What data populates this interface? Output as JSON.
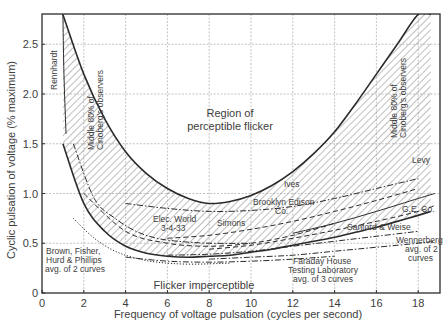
{
  "chart_data": {
    "type": "line",
    "title": "",
    "xlabel": "Frequency of voltage pulsation (cycles per second)",
    "ylabel": "Cyclic pulsation of voltage (% maximum)",
    "xlim": [
      0,
      19
    ],
    "ylim": [
      0,
      2.8
    ],
    "x_ticks": [
      0,
      2,
      4,
      6,
      8,
      10,
      12,
      14,
      16,
      18
    ],
    "x_tick_labels": [
      "0",
      "2",
      "4",
      "6",
      "8",
      "10",
      "12",
      "14",
      "16",
      "18"
    ],
    "y_ticks": [
      0,
      0.5,
      1.0,
      1.5,
      2.0,
      2.5
    ],
    "y_tick_labels": [
      "0",
      "0.5",
      "1.0",
      "1.5",
      "2.0",
      "2.5"
    ],
    "grid": true,
    "legend": "none (curves labeled inline)",
    "regions": {
      "upper": "Region of perceptible flicker",
      "lower": "Flicker imperceptible"
    },
    "band": {
      "name": "Middle 80% of Cinoberg's observers",
      "upper_boundary": {
        "x": [
          1.0,
          2.0,
          3.0,
          4.0,
          5.0,
          6.0,
          7.0,
          8.0,
          9.0,
          10.0,
          11.0,
          12.0,
          13.0,
          14.0,
          15.0,
          16.0,
          17.0,
          18.0,
          18.6
        ],
        "y": [
          2.8,
          2.2,
          1.75,
          1.42,
          1.2,
          1.05,
          0.95,
          0.9,
          0.92,
          0.98,
          1.08,
          1.22,
          1.4,
          1.62,
          1.9,
          2.2,
          2.5,
          2.8,
          2.8
        ]
      },
      "lower_boundary": {
        "x": [
          1.0,
          2.0,
          3.0,
          4.0,
          5.0,
          6.0,
          7.0,
          8.0,
          9.0,
          10.0,
          11.0,
          12.0,
          13.0,
          14.0,
          15.0,
          16.0,
          17.0,
          18.0,
          18.6
        ],
        "y": [
          1.5,
          0.9,
          0.62,
          0.47,
          0.4,
          0.37,
          0.36,
          0.37,
          0.38,
          0.41,
          0.44,
          0.48,
          0.52,
          0.56,
          0.61,
          0.66,
          0.72,
          0.78,
          0.82
        ]
      }
    },
    "series": [
      {
        "name": "Rennhardt",
        "style": "solid",
        "x": [
          1.0,
          1.05,
          1.15
        ],
        "y": [
          2.8,
          2.2,
          1.6
        ]
      },
      {
        "name": "Elec. World 3-4-33",
        "style": "dash-dot",
        "x": [
          1.5,
          2.5,
          3.5,
          4.5,
          5.5,
          6.5,
          8.0,
          10.0
        ],
        "y": [
          1.5,
          0.95,
          0.75,
          0.62,
          0.55,
          0.52,
          0.5,
          0.5
        ]
      },
      {
        "name": "Simons",
        "style": "dashed",
        "x": [
          2.0,
          4.0,
          6.0,
          8.0,
          10.0,
          12.0,
          14.0
        ],
        "y": [
          1.0,
          0.62,
          0.5,
          0.47,
          0.5,
          0.58,
          0.7
        ]
      },
      {
        "name": "Ives",
        "style": "dash-dot",
        "x": [
          4.0,
          6.0,
          8.0,
          10.0,
          12.0,
          14.0,
          16.0,
          18.0
        ],
        "y": [
          0.9,
          0.85,
          0.82,
          0.83,
          0.87,
          0.95,
          1.05,
          1.15
        ]
      },
      {
        "name": "Brooklyn Edison Co.",
        "style": "dashed",
        "x": [
          6.0,
          8.0,
          10.0,
          12.0,
          14.0,
          16.0,
          18.0
        ],
        "y": [
          0.55,
          0.58,
          0.64,
          0.72,
          0.82,
          0.93,
          1.05
        ]
      },
      {
        "name": "Levy",
        "style": "solid",
        "x": [
          12.0,
          14.0,
          16.0,
          18.0,
          18.8
        ],
        "y": [
          0.6,
          0.7,
          0.82,
          0.95,
          1.0
        ]
      },
      {
        "name": "G.E. Co.",
        "style": "dashed",
        "x": [
          8.0,
          10.0,
          12.0,
          14.0,
          16.0,
          18.0,
          18.8
        ],
        "y": [
          0.44,
          0.48,
          0.55,
          0.63,
          0.72,
          0.82,
          0.88
        ]
      },
      {
        "name": "Sanford & Weise",
        "style": "dash-dot",
        "x": [
          6.0,
          8.0,
          10.0,
          12.0,
          14.0,
          16.0,
          18.0
        ],
        "y": [
          0.38,
          0.39,
          0.42,
          0.47,
          0.52,
          0.57,
          0.62
        ]
      },
      {
        "name": "Wennerberg avg. of 2 curves",
        "style": "dash-dot",
        "x": [
          8.0,
          10.0,
          12.0,
          14.0,
          16.0,
          18.0,
          18.8
        ],
        "y": [
          0.34,
          0.36,
          0.38,
          0.42,
          0.46,
          0.5,
          0.52
        ]
      },
      {
        "name": "Faraday House Testing Laboratory avg. of 3 curves",
        "style": "dash-dot",
        "x": [
          4.0,
          6.0,
          8.0,
          10.0,
          12.0,
          14.0
        ],
        "y": [
          0.36,
          0.32,
          0.31,
          0.32,
          0.34,
          0.37
        ]
      },
      {
        "name": "Brown, Fisher, Hurd & Phillips avg. of 2 curves",
        "style": "dotted",
        "x": [
          1.5,
          2.5,
          3.5,
          4.5,
          5.5,
          7.0,
          9.0
        ],
        "y": [
          0.75,
          0.55,
          0.42,
          0.35,
          0.31,
          0.29,
          0.3
        ]
      }
    ],
    "annotations": [
      "Rennhardt",
      "Middle 80% of Cinoberg's observers",
      "Middle 80% of Cinoberg's observers",
      "Region of perceptible flicker",
      "Ives",
      "Brooklyn Edison Co.",
      "Levy",
      "G.E. Co.",
      "Elec. World 3-4-33",
      "Simons",
      "Sanford & Weise",
      "Wennerberg avg. of 2 curves",
      "Brown, Fisher, Hurd & Phillips avg. of 2 curves",
      "Faraday House Testing Laboratory avg. of 3 curves",
      "Flicker imperceptible"
    ]
  },
  "labels": {
    "x_axis": "Frequency of voltage pulsation (cycles per second)",
    "y_axis": "Cyclic pulsation of voltage (% maximum)",
    "region_upper_1": "Region of",
    "region_upper_2": "perceptible flicker",
    "region_lower": "Flicker imperceptible",
    "rennhardt": "Rennhardt",
    "band_left_1": "Middle 80% of",
    "band_left_2": "Cinoberg's observers",
    "band_right_1": "Middle 80% of",
    "band_right_2": "Cinoberg's observers",
    "ives": "Ives",
    "brooklyn_1": "Brooklyn Edison",
    "brooklyn_2": "Co.",
    "levy": "Levy",
    "ge": "G.E. Co.",
    "elec_1": "Elec. World",
    "elec_2": "3-4-33",
    "simons": "Simons",
    "sanford": "Sanford & Weise",
    "wenn_1": "Wennerberg",
    "wenn_2": "avg. of 2",
    "wenn_3": "curves",
    "brown_1": "Brown, Fisher,",
    "brown_2": "Hurd & Phillips",
    "brown_3": "avg. of 2 curves",
    "faraday_1": "Faraday House",
    "faraday_2": "Testing Laboratory",
    "faraday_3": "avg. of 3 curves"
  },
  "colors": {
    "ink": "#2b2b2b",
    "grid": "#9a9a9a",
    "hatch": "#6e6e6e",
    "background": "#ffffff"
  }
}
